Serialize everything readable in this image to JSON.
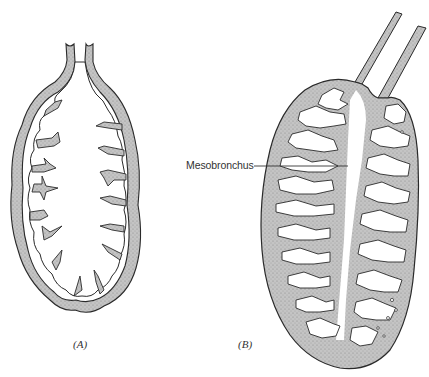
{
  "figure": {
    "panels": [
      {
        "id": "A",
        "label": "(A)",
        "description": "Simple lung sac with short bronchial tube and peripheral septal folds"
      },
      {
        "id": "B",
        "label": "(B)",
        "description": "Complex lung sac with paired tubes and highly subdivided septa around a central mesobronchus"
      }
    ],
    "annotations": [
      {
        "text": "Mesobronchus",
        "target_panel": "B"
      }
    ],
    "colors": {
      "outline": "#2a2a2a",
      "wall_fill": "#b8b8b8",
      "lumen": "#ffffff",
      "text": "#333333"
    }
  }
}
